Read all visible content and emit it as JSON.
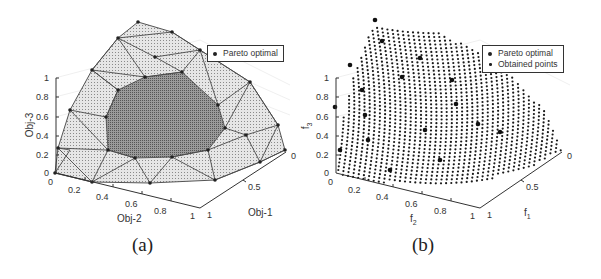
{
  "figure": {
    "panels": [
      {
        "caption": "(a)",
        "legend": [
          "Pareto optimal"
        ],
        "zlabel": "Obj-3",
        "xlabel": "Obj-2",
        "ylabel": "Obj-1",
        "zticks": [
          "1",
          "0.8",
          "0.6",
          "0.4",
          "0.2",
          "0"
        ],
        "xticks": [
          "0",
          "0.2",
          "0.4",
          "0.6",
          "0.8",
          "1"
        ],
        "yticks": [
          "1",
          "0.5",
          "0"
        ]
      },
      {
        "caption": "(b)",
        "legend": [
          "Pareto optimal",
          "Obtained points"
        ],
        "zlabel": "f",
        "zlabel_sub": "3",
        "xlabel": "f",
        "xlabel_sub": "2",
        "ylabel": "f",
        "ylabel_sub": "1",
        "zticks": [
          "1",
          "0.8",
          "0.6",
          "0.4",
          "0.2",
          "0"
        ],
        "xticks": [
          "0",
          "0.2",
          "0.4",
          "0.6",
          "0.8",
          "1"
        ],
        "yticks": [
          "1",
          "0.5",
          "0"
        ]
      }
    ]
  },
  "chart_data": [
    {
      "type": "scatter",
      "subtype": "3d-surface-mesh",
      "title": "(a)",
      "xlabel": "Obj-2",
      "ylabel": "Obj-1",
      "zlabel": "Obj-3",
      "xlim": [
        0,
        1
      ],
      "ylim": [
        0,
        1
      ],
      "zlim": [
        0,
        1
      ],
      "x_ticks": [
        0,
        0.2,
        0.4,
        0.6,
        0.8,
        1
      ],
      "y_ticks": [
        0,
        0.5,
        1
      ],
      "z_ticks": [
        0,
        0.2,
        0.4,
        0.6,
        0.8,
        1
      ],
      "legend": [
        "Pareto optimal"
      ],
      "legend_position": "upper right",
      "grid": true,
      "series": [
        {
          "name": "Pareto optimal",
          "marker": "filled circle",
          "description": "Triangulated Pareto front mesh with reference vertices over the unit simplex-like surface"
        }
      ]
    },
    {
      "type": "scatter",
      "subtype": "3d-scatter",
      "title": "(b)",
      "xlabel": "f_2",
      "ylabel": "f_1",
      "zlabel": "f_3",
      "xlim": [
        0,
        1
      ],
      "ylim": [
        0,
        1
      ],
      "zlim": [
        0,
        1
      ],
      "x_ticks": [
        0,
        0.2,
        0.4,
        0.6,
        0.8,
        1
      ],
      "y_ticks": [
        0,
        0.5,
        1
      ],
      "z_ticks": [
        0,
        0.2,
        0.4,
        0.6,
        0.8,
        1
      ],
      "legend": [
        "Pareto optimal",
        "Obtained points"
      ],
      "legend_position": "upper right",
      "grid": true,
      "series": [
        {
          "name": "Pareto optimal",
          "marker": "large filled circle"
        },
        {
          "name": "Obtained points",
          "marker": "small filled dot",
          "description": "Dense grid of points covering the convex Pareto front"
        }
      ]
    }
  ]
}
